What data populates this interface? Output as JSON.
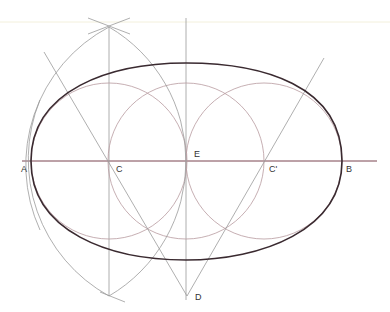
{
  "diagram": {
    "labels": {
      "A": "A",
      "B": "B",
      "C": "C",
      "C_prime": "C'",
      "D": "D",
      "E": "E"
    },
    "points": {
      "A": [
        31,
        161
      ],
      "B": [
        342,
        161
      ],
      "C": [
        109,
        161
      ],
      "E": [
        186,
        161
      ],
      "C_prime": [
        264,
        161
      ],
      "D": [
        187,
        296
      ],
      "top_intersection": [
        109,
        27
      ],
      "bottom_intersection": [
        109,
        296
      ]
    },
    "small_circle_radius": 78,
    "large_arc_radius": 156,
    "colors": {
      "oval": "#3a2a30",
      "axis": "#7a4450",
      "construction": "#9a9a9a",
      "circles": "#b89aa0"
    }
  }
}
